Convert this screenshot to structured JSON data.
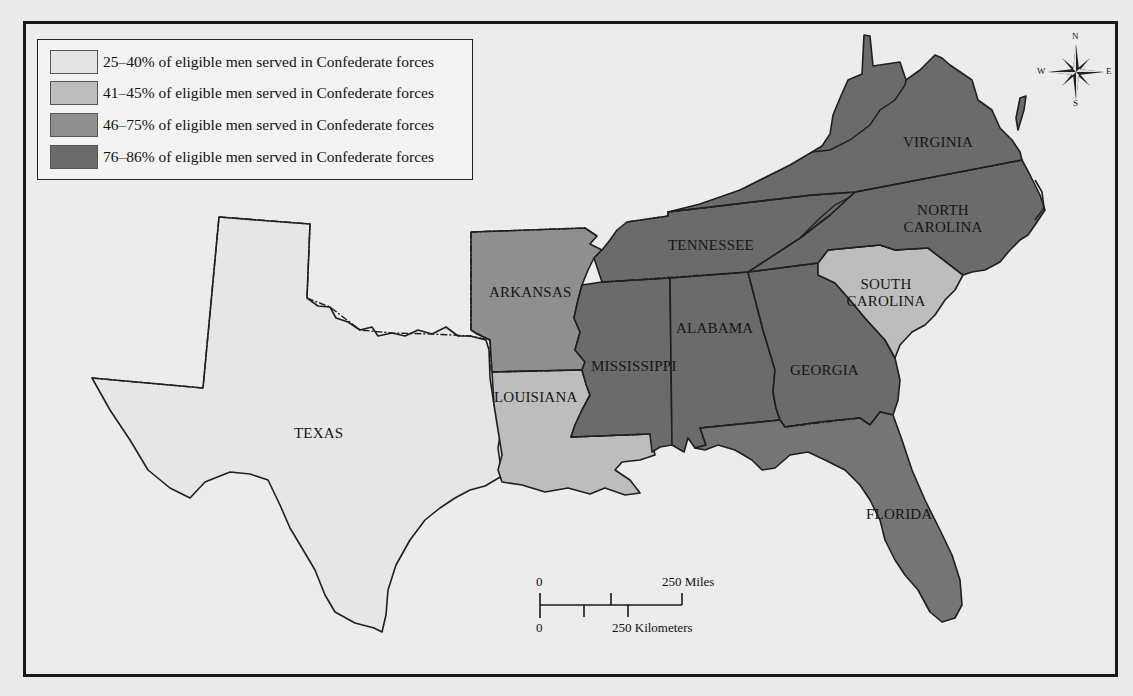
{
  "legend": {
    "items": [
      {
        "label": "25–40% of eligible men served in Confederate forces",
        "color": "#e4e4e4"
      },
      {
        "label": "41–45% of eligible men served in Confederate forces",
        "color": "#bdbdbd"
      },
      {
        "label": "46–75% of eligible men served in Confederate forces",
        "color": "#8f8f8f"
      },
      {
        "label": "76–86% of eligible men served in Confederate forces",
        "color": "#6b6b6b"
      }
    ]
  },
  "states": {
    "texas": {
      "label": "TEXAS",
      "category": "25–40%"
    },
    "arkansas": {
      "label": "ARKANSAS",
      "category": "46–75%"
    },
    "louisiana": {
      "label": "LOUISIANA",
      "category": "41–45%"
    },
    "mississippi": {
      "label": "MISSISSIPPI",
      "category": "76–86%"
    },
    "alabama": {
      "label": "ALABAMA",
      "category": "76–86%"
    },
    "tennessee": {
      "label": "TENNESSEE",
      "category": "76–86%"
    },
    "georgia": {
      "label": "GEORGIA",
      "category": "76–86%"
    },
    "florida": {
      "label": "FLORIDA",
      "category": "46–75%"
    },
    "south_carolina": {
      "label_line1": "SOUTH",
      "label_line2": "CAROLINA",
      "category": "41–45%"
    },
    "north_carolina": {
      "label_line1": "NORTH",
      "label_line2": "CAROLINA",
      "category": "76–86%"
    },
    "virginia": {
      "label": "VIRGINIA",
      "category": "76–86%"
    }
  },
  "scale": {
    "miles_zero": "0",
    "miles_label": "250 Miles",
    "km_zero": "0",
    "km_label": "250 Kilometers"
  },
  "compass": {
    "n": "N",
    "s": "S",
    "e": "E",
    "w": "W"
  }
}
